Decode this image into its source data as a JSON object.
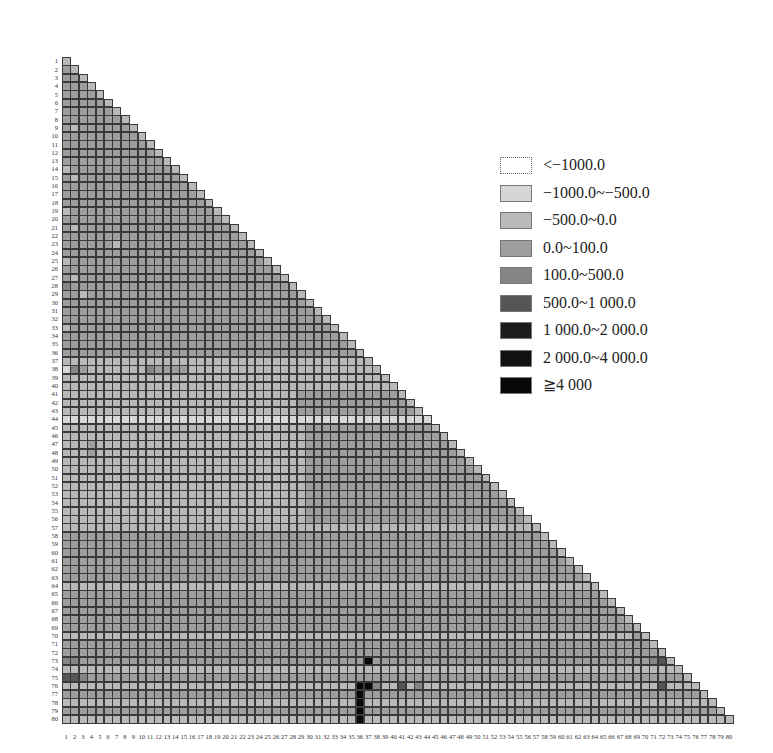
{
  "chart_data": {
    "type": "heatmap",
    "title": "",
    "xlabel": "",
    "ylabel": "",
    "shape": "lower-triangular",
    "size": 80,
    "x_tick_labels": [
      "1",
      "2",
      "3",
      "4",
      "5",
      "6",
      "7",
      "8",
      "9",
      "10",
      "11",
      "12",
      "13",
      "14",
      "15",
      "16",
      "17",
      "18",
      "19",
      "20",
      "21",
      "22",
      "23",
      "24",
      "25",
      "26",
      "27",
      "28",
      "29",
      "30",
      "31",
      "32",
      "33",
      "34",
      "35",
      "36",
      "37",
      "38",
      "39",
      "40",
      "41",
      "42",
      "43",
      "44",
      "45",
      "46",
      "47",
      "48",
      "49",
      "50",
      "51",
      "52",
      "53",
      "54",
      "55",
      "56",
      "57",
      "58",
      "59",
      "60",
      "61",
      "62",
      "63",
      "64",
      "65",
      "66",
      "67",
      "68",
      "69",
      "70",
      "71",
      "72",
      "73",
      "74",
      "75",
      "76",
      "77",
      "78",
      "79",
      "80"
    ],
    "y_tick_labels": [
      "1",
      "2",
      "3",
      "4",
      "5",
      "6",
      "7",
      "8",
      "9",
      "10",
      "11",
      "12",
      "13",
      "14",
      "15",
      "16",
      "17",
      "18",
      "19",
      "20",
      "21",
      "22",
      "23",
      "24",
      "25",
      "26",
      "27",
      "28",
      "29",
      "30",
      "31",
      "32",
      "33",
      "34",
      "35",
      "36",
      "37",
      "38",
      "39",
      "40",
      "41",
      "42",
      "43",
      "44",
      "45",
      "46",
      "47",
      "48",
      "49",
      "50",
      "51",
      "52",
      "53",
      "54",
      "55",
      "56",
      "57",
      "58",
      "59",
      "60",
      "61",
      "62",
      "63",
      "64",
      "65",
      "66",
      "67",
      "68",
      "69",
      "70",
      "71",
      "72",
      "73",
      "74",
      "75",
      "76",
      "77",
      "78",
      "79",
      "80"
    ],
    "legend": [
      {
        "label": "<−1000.0",
        "color": "#ffffff"
      },
      {
        "label": "−1000.0~−500.0",
        "color": "#d6d6d6"
      },
      {
        "label": "−500.0~0.0",
        "color": "#b9b9b9"
      },
      {
        "label": "0.0~100.0",
        "color": "#9e9e9e"
      },
      {
        "label": "100.0~500.0",
        "color": "#858585"
      },
      {
        "label": "500.0~1 000.0",
        "color": "#555555"
      },
      {
        "label": "1 000.0~2 000.0",
        "color": "#1c1c1c"
      },
      {
        "label": "2 000.0~4 000.0",
        "color": "#111111"
      },
      {
        "label": "≧4 000",
        "color": "#080808"
      }
    ],
    "legend_position": "upper-right",
    "grid": true,
    "cell_class_note": "Each row string gives the legend class index (0-8) for columns 1..row (lower triangle).",
    "rows": [
      "2",
      "32",
      "332",
      "3332",
      "33332",
      "333332",
      "3333332",
      "33333332",
      "323333332",
      "3333333332",
      "33333333332",
      "333333333332",
      "3333333333332",
      "23333333333332",
      "323333333333332",
      "3333333333333332",
      "33333333333333332",
      "333333333333333332",
      "2333333333333333332",
      "33333333333333333332",
      "323333333333333333332",
      "3333333333333333333332",
      "33333323333333333333332",
      "333333333333333333333332",
      "2333333333333333333333332",
      "33333333333333333333333332",
      "323333333333333333333333332",
      "4333333333333333333333333332",
      "33233333333333333333333333332",
      "333333333333333333333333333332",
      "3333333333333333333333333333332",
      "33333333333333333333333333333332",
      "233333333333333333333333333333332",
      "3333333333333333333333333333333332",
      "33333333333333333333333333333333332",
      "333333333333333333333333333333333332",
      "2222222222222222222222222222222222222",
      "14322222224333322222222222222222222222",
      "222222222222222222222222222222222222222",
      "2222222222222222222222222222222222222222",
      "22222222222222222222222222223333333333332",
      "222222222222222222222222222233333333333332",
      "2222222222222222222222222222333333333333332",
      "11111111111111111111111111111111111111111111",
      "222222222222222222222222222223333333333333332",
      "2222222222222222222222222222233333333333333332",
      "22232222222222222222222222222333333333333333332",
      "222322222222222222222222222223333333333333333332",
      "2222222222222222222222222222233333333333333333332",
      "22222222222222222222222222222333333333333333333332",
      "222222222222222222222222222223333333333333333333332",
      "2222222222222222222222222222233333333333333333333332",
      "22222222222222222222222222222333333333333333333333332",
      "222222222222222222222222222223333333333333333333333332",
      "2222222222222222222222222222233333333333333333333333332",
      "22222222222222222222222222222333333333333333333333333332",
      "222222222222222222222222222222222222222222222222222222222",
      "3333333333333333333333333333333333333333333333333333333332",
      "33333333333333333333333333333333333333333333333333333333332",
      "333333333333333333333333333333333333333333333333333333333332",
      "3333333333333333333333333333333333333333333333333333333333332",
      "33333333333333333333333333333333333333333333333333333333333332",
      "333333333333333333333333333333333333333333333333333333333333332",
      "2222222222222222222222222222222222222222222222222222222222222222",
      "33333333333333333333333333333333333333333333333333333333333333332",
      "333333333333333333333333333333333333333333333333333333333333333332",
      "3333333333333333333333333333333333333333333333333333333333333333332",
      "33333333333333333333333333333333333333333333333333333333333333333332",
      "333333333333333333333333333333333333333333333333333333333333333333332",
      "2222222222222222222222222222222222222222222222222222222222222222222232",
      "33333333333333333333333333333333333333333333333333333333333333333333332",
      "333333333333333333333333333333333333333333333333333333333333333333333332",
      "4433333333333333333333333333333333338333333333333333333333333333333333452",
      "22222222222222222222222222222222222222222222222222222222222222222222222222",
      "554333333333333333333333333333333333333333333333333333333333333333333333332",
      "2222222222222222222222222222222222288422524222222222222222222222222222252222",
      "33333333333333333333333333333333333833333333333333333333333333333333333333332",
      "222222222222222222222222222222222228222222222222222222222222222222222222222222",
      "3333333333333333333333333333333333383333333333333333333333333333333333333333332",
      "22222222222222222222222222222222222822222222222222222222222222222222222222222222"
    ]
  }
}
